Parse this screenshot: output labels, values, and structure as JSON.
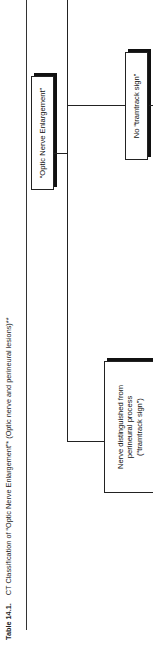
{
  "caption": {
    "label": "Table 14.1.",
    "text": "CT Classification of “Optic Nerve Enlargement”* (Optic nerve and perineural lesions)**"
  },
  "flowchart": {
    "root": {
      "label": "“Optic Nerve Enlargement”"
    },
    "branches": [
      {
        "label": "No “tramtrack sign”"
      },
      {
        "label_lines": [
          "Nerve distinguished from",
          "perineural process",
          "(“tramtrack sign”)"
        ]
      }
    ]
  },
  "colors": {
    "line": "#222222",
    "background": "#ffffff",
    "shadow": "#111111"
  }
}
